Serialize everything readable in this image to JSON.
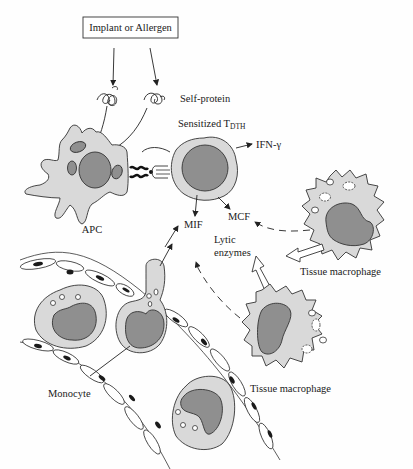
{
  "diagram": {
    "title_box": "Implant or Allergen",
    "labels": {
      "self_protein": "Self-protein",
      "sensitized_t": "Sensitized T",
      "sensitized_t_sub": "DTH",
      "ifn": "IFN-γ",
      "apc": "APC",
      "mif": "MIF",
      "mcf": "MCF",
      "lytic_1": "Lytic",
      "lytic_2": "enzymes",
      "tissue_macrophage_top": "Tissue macrophage",
      "tissue_macrophage_bottom": "Tissue macrophage",
      "monocyte": "Monocyte"
    },
    "colors": {
      "cytoplasm": "#d9d9d9",
      "nucleus": "#8f8f8f",
      "outline": "#333333",
      "background": "#fefefe"
    }
  }
}
